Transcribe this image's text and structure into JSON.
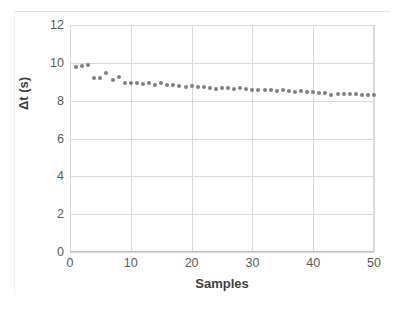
{
  "chart_data": {
    "type": "scatter",
    "title": "",
    "xlabel": "Samples",
    "ylabel": "Δt (s)",
    "xlim": [
      0,
      50
    ],
    "ylim": [
      0,
      12
    ],
    "xticks": [
      0,
      10,
      20,
      30,
      40,
      50
    ],
    "yticks": [
      0,
      2,
      4,
      6,
      8,
      10,
      12
    ],
    "grid": "horizontal-and-vertical-at-ticks",
    "legend": "none",
    "marker_color": "#808080",
    "gridline_color": "#d9d9d9",
    "axis_text_color": "#595959",
    "title_text_color": "#404040",
    "series": [
      {
        "name": "Δt",
        "x": [
          1,
          2,
          3,
          4,
          5,
          6,
          7,
          8,
          9,
          10,
          11,
          12,
          13,
          14,
          15,
          16,
          17,
          18,
          19,
          20,
          21,
          22,
          23,
          24,
          25,
          26,
          27,
          28,
          29,
          30,
          31,
          32,
          33,
          34,
          35,
          36,
          37,
          38,
          39,
          40,
          41,
          42,
          43,
          44,
          45,
          46,
          47,
          48,
          49,
          50
        ],
        "values": [
          9.8,
          9.85,
          9.9,
          9.2,
          9.22,
          9.45,
          9.1,
          9.25,
          8.92,
          8.93,
          8.95,
          8.88,
          8.93,
          8.85,
          8.95,
          8.82,
          8.85,
          8.8,
          8.72,
          8.78,
          8.7,
          8.7,
          8.68,
          8.62,
          8.68,
          8.65,
          8.62,
          8.65,
          8.6,
          8.58,
          8.58,
          8.58,
          8.55,
          8.52,
          8.55,
          8.5,
          8.48,
          8.5,
          8.45,
          8.45,
          8.42,
          8.4,
          8.3,
          8.33,
          8.35,
          8.35,
          8.35,
          8.28,
          8.3,
          8.3
        ]
      }
    ]
  },
  "axis": {
    "y_title": "Δt (s)",
    "x_title": "Samples"
  }
}
